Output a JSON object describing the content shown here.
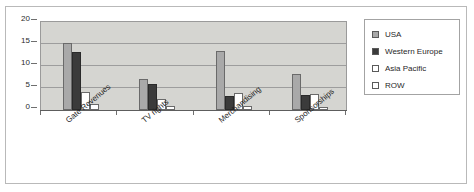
{
  "chart_data": {
    "type": "bar",
    "title": "",
    "subtitle": "",
    "xlabel": "",
    "ylabel": "",
    "ylim": [
      0,
      20
    ],
    "yticks": [
      "0",
      "5",
      "10",
      "15",
      "20"
    ],
    "grid": true,
    "legend_position": "right",
    "categories": [
      "Gate Revenues",
      "TV rights",
      "Merchandising",
      "Sponsorships"
    ],
    "series": [
      {
        "name": "USA",
        "color": "#a9a9a9",
        "values": [
          15.3,
          7.0,
          13.5,
          8.2
        ]
      },
      {
        "name": "Western Europe",
        "color": "#3b3b3b",
        "values": [
          13.2,
          6.0,
          3.2,
          3.3
        ]
      },
      {
        "name": "Asia Pacific",
        "color": "#ffffff",
        "values": [
          4.0,
          2.5,
          3.8,
          3.6
        ]
      },
      {
        "name": "ROW",
        "color": "#ffffff",
        "values": [
          1.3,
          1.0,
          0.8,
          0.7
        ]
      }
    ]
  },
  "legend": {
    "entries": [
      {
        "label": "USA"
      },
      {
        "label": "Western Europe"
      },
      {
        "label": "Asia Pacific"
      },
      {
        "label": "ROW"
      }
    ]
  },
  "colors": {
    "plot_background": "#d5d5d1",
    "gridline": "#9d9d9d",
    "axis": "#5d5d5d",
    "border": "#b9b9b9",
    "text": "#1f1f1f"
  }
}
